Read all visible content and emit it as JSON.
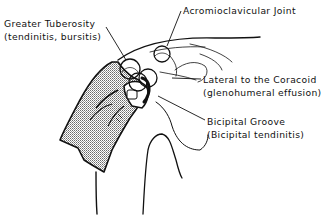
{
  "diagram": {
    "labels": [
      {
        "id": "greater-tuberosity",
        "name": "Greater Tuberosity",
        "detail": "(tendinitis, bursitis)"
      },
      {
        "id": "acromioclavicular-joint",
        "name": "Acromioclavicular Joint",
        "detail": ""
      },
      {
        "id": "lateral-to-coracoid",
        "name": "Lateral to the Coracoid",
        "detail": "(glenohumeral effusion)"
      },
      {
        "id": "bicipital-groove",
        "name": "Bicipital Groove",
        "detail": "(Bicipital tendinitis)"
      }
    ],
    "colors": {
      "line": "#111111",
      "shading": "#b8b8b8",
      "background": "#ffffff"
    }
  }
}
